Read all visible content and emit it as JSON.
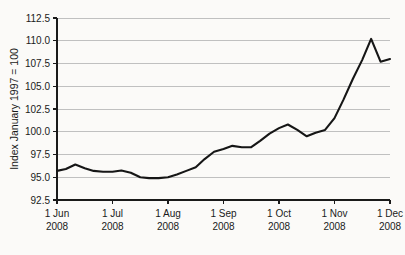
{
  "chart_data": {
    "type": "line",
    "title": "",
    "xlabel": "",
    "ylabel": "Index January 1997 = 100",
    "ylim": [
      92.5,
      112.5
    ],
    "yticks": [
      "92.5",
      "95.0",
      "97.5",
      "100.0",
      "102.5",
      "105.0",
      "107.5",
      "110.0",
      "112.5"
    ],
    "ytick_values": [
      92.5,
      95.0,
      97.5,
      100.0,
      102.5,
      105.0,
      107.5,
      110.0,
      112.5
    ],
    "xticks": [
      {
        "line1": "1 Jun",
        "line2": "2008"
      },
      {
        "line1": "1 Jul",
        "line2": "2008"
      },
      {
        "line1": "1 Aug",
        "line2": "2008"
      },
      {
        "line1": "1 Sep",
        "line2": "2008"
      },
      {
        "line1": "1 Oct",
        "line2": "2008"
      },
      {
        "line1": "1 Nov",
        "line2": "2008"
      },
      {
        "line1": "1 Dec",
        "line2": "2008"
      }
    ],
    "xlim": [
      0,
      6
    ],
    "grid": "horizontal",
    "legend": "none",
    "line_color": "#161616",
    "grid_color": "#b9b9b9",
    "background_color": "#fbfaf8",
    "series": [
      {
        "name": "Index",
        "x": [
          0.0,
          0.16,
          0.33,
          0.5,
          0.66,
          0.83,
          1.0,
          1.16,
          1.33,
          1.5,
          1.66,
          1.83,
          2.0,
          2.16,
          2.33,
          2.5,
          2.66,
          2.83,
          3.0,
          3.16,
          3.33,
          3.5,
          3.66,
          3.83,
          4.0,
          4.16,
          4.33,
          4.5,
          4.66,
          4.83,
          5.0,
          5.16,
          5.33,
          5.5,
          5.66,
          5.83,
          6.0
        ],
        "values": [
          95.7,
          95.9,
          96.4,
          96.0,
          95.7,
          95.6,
          95.6,
          95.75,
          95.5,
          95.0,
          94.9,
          94.9,
          95.0,
          95.3,
          95.7,
          96.1,
          97.0,
          97.8,
          98.1,
          98.45,
          98.3,
          98.3,
          99.0,
          99.8,
          100.4,
          100.8,
          100.2,
          99.5,
          99.9,
          100.2,
          101.5,
          103.5,
          105.8,
          107.9,
          110.2,
          107.7,
          108.0
        ]
      }
    ]
  }
}
